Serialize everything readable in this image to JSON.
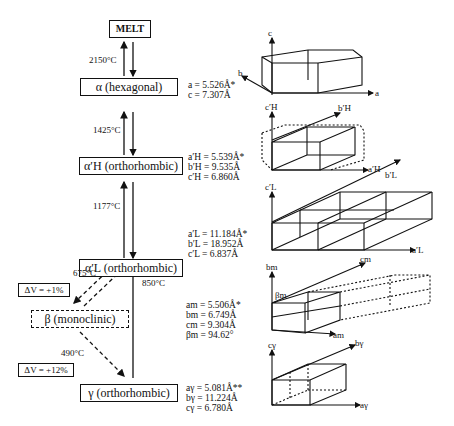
{
  "phases": {
    "melt": {
      "label": "MELT"
    },
    "alpha": {
      "label": "α (hexagonal)",
      "params": [
        "a = 5.526Å*",
        "c = 7.307Å"
      ]
    },
    "alpha_h": {
      "label": "α′H (orthorhombic)",
      "params": [
        "a′H = 5.539Å*",
        "b′H = 9.535Å",
        "c′H = 6.860Å"
      ]
    },
    "alpha_l": {
      "label": "α′L (orthorhombic)",
      "params": [
        "a′L = 11.184Å*",
        "b′L = 18.952Å",
        "c′L =  6.837Å"
      ]
    },
    "beta": {
      "label": "β (monoclinic)",
      "params": [
        "am = 5.506Å*",
        "bm = 6.749Å",
        "cm = 9.304Å",
        "βm = 94.62°"
      ]
    },
    "gamma": {
      "label": "γ (orthorhombic)",
      "params": [
        "aγ =  5.081Å**",
        "bγ = 11.224Å",
        "cγ =  6.780Å"
      ]
    }
  },
  "transitions": {
    "melt_alpha": "2150°C",
    "alpha_alphah": "1425°C",
    "alphah_alphal": "1177°C",
    "alphal_beta": "675°C",
    "gamma_alphal": "850°C",
    "beta_gamma": "490°C"
  },
  "volume_changes": {
    "alphal_beta": "ΔV = +1%",
    "beta_gamma": "ΔV = +12%"
  },
  "axes": {
    "alpha": {
      "c": "c",
      "b": "b",
      "a": "a"
    },
    "alpha_h": {
      "c": "c′H",
      "b": "b′H",
      "a": "a′H"
    },
    "alpha_l": {
      "c": "c′L",
      "b": "b′L",
      "a": "a′L"
    },
    "beta": {
      "b": "bm",
      "c": "cm",
      "a": "am",
      "angle": "βm"
    },
    "gamma": {
      "c": "cγ",
      "b": "bγ",
      "a": "aγ"
    }
  }
}
